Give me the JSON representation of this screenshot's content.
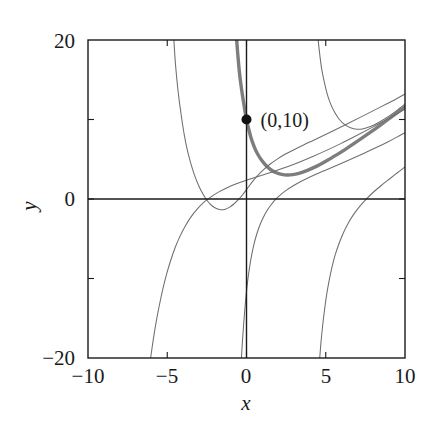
{
  "chart_data": {
    "type": "line",
    "title": "",
    "xlabel": "x",
    "ylabel": "y",
    "xlim": [
      -10,
      10
    ],
    "ylim": [
      -20,
      20
    ],
    "grid": false,
    "legend": null,
    "x_ticks": [
      -10,
      -5,
      0,
      5,
      10
    ],
    "x_tick_labels": [
      "−10",
      "−5",
      "0",
      "5",
      "10"
    ],
    "y_ticks": [
      -20,
      -10,
      0,
      10,
      20
    ],
    "y_tick_labels": [
      "−20",
      "",
      "0",
      "",
      "20"
    ],
    "axis_lines": {
      "x_axis_at_y": 0,
      "y_axis_at_x": 0
    },
    "annotations": [
      {
        "label": "(0,10)",
        "x": 0,
        "y": 10,
        "marker": "filled-circle"
      }
    ],
    "series": [
      {
        "name": "solution-through-0-10",
        "emphasis": "thick",
        "color": "#7d7d7d",
        "points": [
          [
            -0.62,
            20.0
          ],
          [
            -0.55,
            18.2
          ],
          [
            -0.45,
            16.0
          ],
          [
            -0.34,
            14.2
          ],
          [
            -0.22,
            12.6
          ],
          [
            -0.1,
            11.1
          ],
          [
            0.0,
            10.0
          ],
          [
            0.14,
            8.8
          ],
          [
            0.3,
            7.6
          ],
          [
            0.5,
            6.5
          ],
          [
            0.72,
            5.6
          ],
          [
            0.98,
            4.8
          ],
          [
            1.26,
            4.15
          ],
          [
            1.56,
            3.65
          ],
          [
            1.88,
            3.3
          ],
          [
            2.22,
            3.1
          ],
          [
            2.56,
            3.02
          ],
          [
            2.92,
            3.06
          ],
          [
            3.3,
            3.22
          ],
          [
            3.72,
            3.5
          ],
          [
            4.16,
            3.88
          ],
          [
            4.64,
            4.35
          ],
          [
            5.14,
            4.9
          ],
          [
            5.68,
            5.55
          ],
          [
            6.24,
            6.25
          ],
          [
            6.84,
            7.05
          ],
          [
            7.46,
            7.9
          ],
          [
            8.1,
            8.8
          ],
          [
            8.78,
            9.78
          ],
          [
            9.4,
            10.7
          ],
          [
            10.0,
            11.6
          ]
        ]
      },
      {
        "name": "solution-left-branch-upper",
        "emphasis": "thin",
        "color": "#6e6e6e",
        "points": [
          [
            -4.58,
            20.0
          ],
          [
            -4.52,
            18.0
          ],
          [
            -4.44,
            16.0
          ],
          [
            -4.34,
            14.0
          ],
          [
            -4.22,
            12.0
          ],
          [
            -4.08,
            10.0
          ],
          [
            -3.92,
            8.0
          ],
          [
            -3.74,
            6.2
          ],
          [
            -3.52,
            4.5
          ],
          [
            -3.28,
            3.0
          ],
          [
            -3.02,
            1.7
          ],
          [
            -2.74,
            0.6
          ],
          [
            -2.46,
            -0.25
          ],
          [
            -2.18,
            -0.85
          ],
          [
            -1.9,
            -1.2
          ],
          [
            -1.62,
            -1.35
          ],
          [
            -1.34,
            -1.28
          ],
          [
            -1.06,
            -1.02
          ],
          [
            -0.78,
            -0.6
          ],
          [
            -0.5,
            -0.05
          ],
          [
            -0.22,
            0.6
          ],
          [
            0.06,
            1.35
          ],
          [
            0.36,
            2.15
          ],
          [
            0.7,
            2.95
          ],
          [
            1.08,
            3.7
          ],
          [
            1.5,
            4.4
          ],
          [
            1.96,
            5.05
          ],
          [
            2.46,
            5.65
          ],
          [
            3.0,
            6.2
          ],
          [
            3.6,
            6.8
          ],
          [
            4.24,
            7.4
          ],
          [
            4.92,
            8.05
          ],
          [
            5.64,
            8.75
          ],
          [
            6.4,
            9.5
          ],
          [
            7.2,
            10.3
          ],
          [
            8.04,
            11.15
          ],
          [
            8.92,
            12.05
          ],
          [
            9.5,
            12.65
          ],
          [
            10.0,
            13.2
          ]
        ]
      },
      {
        "name": "solution-right-branch-upper",
        "emphasis": "thin",
        "color": "#6e6e6e",
        "points": [
          [
            4.52,
            20.0
          ],
          [
            4.62,
            18.2
          ],
          [
            4.74,
            16.4
          ],
          [
            4.9,
            14.8
          ],
          [
            5.08,
            13.3
          ],
          [
            5.3,
            12.0
          ],
          [
            5.56,
            10.9
          ],
          [
            5.86,
            10.0
          ],
          [
            6.2,
            9.35
          ],
          [
            6.56,
            8.95
          ],
          [
            6.96,
            8.78
          ],
          [
            7.38,
            8.85
          ],
          [
            7.82,
            9.12
          ],
          [
            8.28,
            9.55
          ],
          [
            8.76,
            10.12
          ],
          [
            9.26,
            10.8
          ],
          [
            9.64,
            11.38
          ],
          [
            10.0,
            11.95
          ]
        ]
      },
      {
        "name": "solution-lower-left",
        "emphasis": "thin",
        "color": "#6e6e6e",
        "points": [
          [
            -6.05,
            -20.0
          ],
          [
            -5.92,
            -18.2
          ],
          [
            -5.78,
            -16.4
          ],
          [
            -5.62,
            -14.6
          ],
          [
            -5.44,
            -12.8
          ],
          [
            -5.24,
            -11.0
          ],
          [
            -5.02,
            -9.3
          ],
          [
            -4.78,
            -7.7
          ],
          [
            -4.5,
            -6.1
          ],
          [
            -4.2,
            -4.7
          ],
          [
            -3.86,
            -3.4
          ],
          [
            -3.5,
            -2.25
          ],
          [
            -3.1,
            -1.25
          ],
          [
            -2.68,
            -0.4
          ],
          [
            -2.22,
            0.3
          ],
          [
            -1.74,
            0.9
          ],
          [
            -1.22,
            1.42
          ],
          [
            -0.68,
            1.88
          ],
          [
            -0.1,
            2.3
          ],
          [
            0.52,
            2.7
          ],
          [
            1.18,
            3.12
          ],
          [
            1.88,
            3.58
          ],
          [
            2.62,
            4.1
          ],
          [
            3.4,
            4.7
          ],
          [
            4.22,
            5.38
          ],
          [
            5.08,
            6.15
          ],
          [
            5.98,
            7.0
          ],
          [
            6.92,
            7.95
          ],
          [
            7.9,
            8.98
          ],
          [
            8.92,
            10.08
          ],
          [
            9.5,
            10.72
          ],
          [
            10.0,
            11.3
          ]
        ]
      },
      {
        "name": "solution-through-origin-steep",
        "emphasis": "thin",
        "color": "#6e6e6e",
        "points": [
          [
            -0.32,
            -20.0
          ],
          [
            -0.26,
            -18.0
          ],
          [
            -0.19,
            -16.0
          ],
          [
            -0.11,
            -14.0
          ],
          [
            -0.02,
            -12.0
          ],
          [
            0.08,
            -10.2
          ],
          [
            0.2,
            -8.5
          ],
          [
            0.33,
            -7.0
          ],
          [
            0.48,
            -5.6
          ],
          [
            0.65,
            -4.4
          ],
          [
            0.84,
            -3.3
          ],
          [
            1.05,
            -2.35
          ],
          [
            1.28,
            -1.5
          ],
          [
            1.54,
            -0.75
          ],
          [
            1.82,
            -0.08
          ],
          [
            2.14,
            0.52
          ],
          [
            2.5,
            1.08
          ],
          [
            2.9,
            1.6
          ],
          [
            3.34,
            2.1
          ],
          [
            3.84,
            2.6
          ],
          [
            4.38,
            3.1
          ],
          [
            4.98,
            3.62
          ],
          [
            5.64,
            4.18
          ],
          [
            6.36,
            4.8
          ],
          [
            7.14,
            5.5
          ],
          [
            7.98,
            6.28
          ],
          [
            8.88,
            7.15
          ],
          [
            9.46,
            7.75
          ],
          [
            10.0,
            8.35
          ]
        ]
      },
      {
        "name": "solution-lower-right-steep",
        "emphasis": "thin",
        "color": "#6e6e6e",
        "points": [
          [
            4.62,
            -20.0
          ],
          [
            4.7,
            -18.0
          ],
          [
            4.8,
            -16.0
          ],
          [
            4.92,
            -14.0
          ],
          [
            5.06,
            -12.0
          ],
          [
            5.22,
            -10.2
          ],
          [
            5.4,
            -8.5
          ],
          [
            5.6,
            -7.0
          ],
          [
            5.84,
            -5.6
          ],
          [
            6.1,
            -4.3
          ],
          [
            6.4,
            -3.1
          ],
          [
            6.74,
            -2.0
          ],
          [
            7.12,
            -1.0
          ],
          [
            7.54,
            -0.05
          ],
          [
            8.0,
            0.85
          ],
          [
            8.5,
            1.7
          ],
          [
            9.04,
            2.55
          ],
          [
            9.52,
            3.3
          ],
          [
            10.0,
            4.05
          ]
        ]
      }
    ]
  },
  "plot_frame": {
    "left_px": 88,
    "right_px": 405,
    "top_px": 40,
    "bottom_px": 358
  }
}
